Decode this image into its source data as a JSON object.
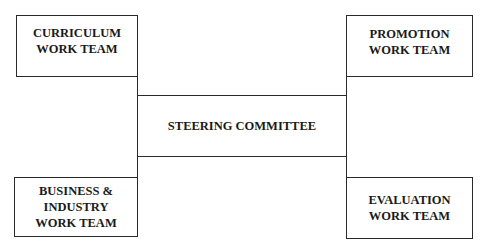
{
  "diagram": {
    "center": {
      "label": "STEERING COMMITTEE"
    },
    "teams": [
      {
        "label": "CURRICULUM\nWORK TEAM",
        "position": "top-left"
      },
      {
        "label": "PROMOTION\nWORK TEAM",
        "position": "top-right"
      },
      {
        "label": "BUSINESS &\nINDUSTRY\nWORK TEAM",
        "position": "bottom-left"
      },
      {
        "label": "EVALUATION\nWORK TEAM",
        "position": "bottom-right"
      }
    ]
  }
}
